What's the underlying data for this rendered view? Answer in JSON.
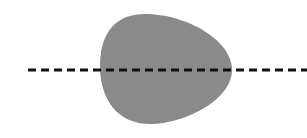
{
  "diagram": {
    "shape": {
      "type": "rounded-egg-blob",
      "fill": "#8a8a8a"
    },
    "line": {
      "style": "dashed",
      "color": "#111111",
      "y": 70
    },
    "background": "#ffffff"
  }
}
